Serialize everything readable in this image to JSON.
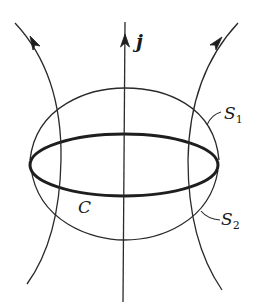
{
  "figure": {
    "type": "diagram",
    "colors": {
      "background": "#ffffff",
      "stroke": "#2a2a2a",
      "label": "#1a1a1a"
    },
    "labels": {
      "current_density": "j",
      "curve": "C",
      "surface_1": "S",
      "surface_1_subscript": "1",
      "surface_2": "S",
      "surface_2_subscript": "2"
    },
    "elements": {
      "field_lines": [
        {
          "name": "left-field-line",
          "direction": "up"
        },
        {
          "name": "center-field-line",
          "direction": "up"
        },
        {
          "name": "right-field-line",
          "direction": "up"
        }
      ],
      "upper_surface": "S1",
      "lower_surface": "S2",
      "boundary_curve": "C"
    }
  }
}
